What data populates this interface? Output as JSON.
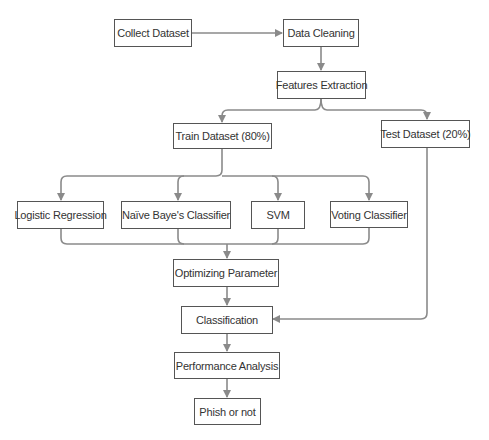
{
  "diagram": {
    "type": "flowchart",
    "colors": {
      "edge": "#8a8a8a",
      "border": "#555555",
      "text": "#333333"
    },
    "nodes": [
      {
        "id": "collect",
        "label": "Collect Dataset"
      },
      {
        "id": "cleaning",
        "label": "Data Cleaning"
      },
      {
        "id": "features",
        "label": "Features Extraction"
      },
      {
        "id": "train",
        "label": "Train Dataset (80%)"
      },
      {
        "id": "test",
        "label": "Test Dataset (20%)"
      },
      {
        "id": "logreg",
        "label": "Logistic Regression"
      },
      {
        "id": "nb",
        "label": "Naïve Baye's Classifier"
      },
      {
        "id": "svm",
        "label": "SVM"
      },
      {
        "id": "voting",
        "label": "Voting Classifier"
      },
      {
        "id": "optimize",
        "label": "Optimizing Parameter"
      },
      {
        "id": "classification",
        "label": "Classification"
      },
      {
        "id": "performance",
        "label": "Performance Analysis"
      },
      {
        "id": "phish",
        "label": "Phish or not"
      }
    ],
    "edges": [
      [
        "collect",
        "cleaning"
      ],
      [
        "cleaning",
        "features"
      ],
      [
        "features",
        "train"
      ],
      [
        "features",
        "test"
      ],
      [
        "train",
        "logreg"
      ],
      [
        "train",
        "nb"
      ],
      [
        "train",
        "svm"
      ],
      [
        "train",
        "voting"
      ],
      [
        "logreg",
        "optimize"
      ],
      [
        "nb",
        "optimize"
      ],
      [
        "svm",
        "optimize"
      ],
      [
        "voting",
        "optimize"
      ],
      [
        "optimize",
        "classification"
      ],
      [
        "test",
        "classification"
      ],
      [
        "classification",
        "performance"
      ],
      [
        "performance",
        "phish"
      ]
    ]
  }
}
